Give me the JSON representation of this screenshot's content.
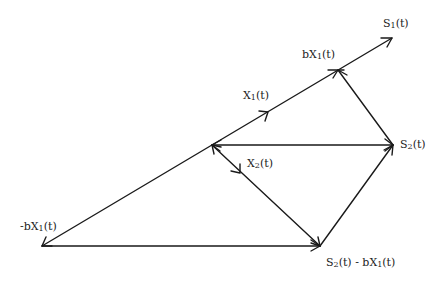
{
  "diagram": {
    "type": "vector-diagram",
    "colors": {
      "stroke": "#1a1a1a",
      "text": "#222222",
      "background": "#ffffff"
    },
    "labels": {
      "s1": {
        "main": "S",
        "sub": "1",
        "tail": "(t)"
      },
      "bx1": {
        "prefix": "bX",
        "sub": "1",
        "tail": "(t)"
      },
      "x1": {
        "main": "X",
        "sub": "1",
        "tail": "(t)"
      },
      "s2": {
        "main": "S",
        "sub": "2",
        "tail": "(t)"
      },
      "x2": {
        "main": "X",
        "sub": "2",
        "tail": "(t)"
      },
      "neg_bx1": {
        "prefix": "-bX",
        "sub": "1",
        "tail": "(t)"
      },
      "s2_minus_bx1": {
        "main": "S",
        "sub": "2",
        "mid": "(t) - bX",
        "sub2": "1",
        "tail": "(t)"
      }
    },
    "points": {
      "neg_bx1": [
        42,
        246
      ],
      "origin": [
        212,
        145
      ],
      "x1_tip": [
        268,
        112
      ],
      "bx1": [
        338,
        70
      ],
      "s1_tip": [
        392,
        38
      ],
      "s2": [
        393,
        145
      ],
      "x2_tip": [
        240,
        173
      ],
      "s2_minus_bx1": [
        320,
        246
      ]
    },
    "vectors": [
      {
        "name": "s1-vector",
        "from": "neg_bx1",
        "to": "s1_tip"
      },
      {
        "name": "x1-vector",
        "from": "origin",
        "to": "x1_tip"
      },
      {
        "name": "s2-vector",
        "from": "origin",
        "to": "s2"
      },
      {
        "name": "x2-vector",
        "from": "origin",
        "to": "x2_tip"
      },
      {
        "name": "bx1-from-s2-vector",
        "from": "s2",
        "to": "bx1"
      },
      {
        "name": "neg-bx1-vector",
        "from": "origin",
        "to": "neg_bx1"
      },
      {
        "name": "bottom-vector",
        "from": "neg_bx1",
        "to": "s2_minus_bx1"
      },
      {
        "name": "diagonal-vector",
        "from": "origin",
        "to": "s2_minus_bx1"
      },
      {
        "name": "right-lower-vector",
        "from": "s2_minus_bx1",
        "to": "s2"
      }
    ]
  }
}
